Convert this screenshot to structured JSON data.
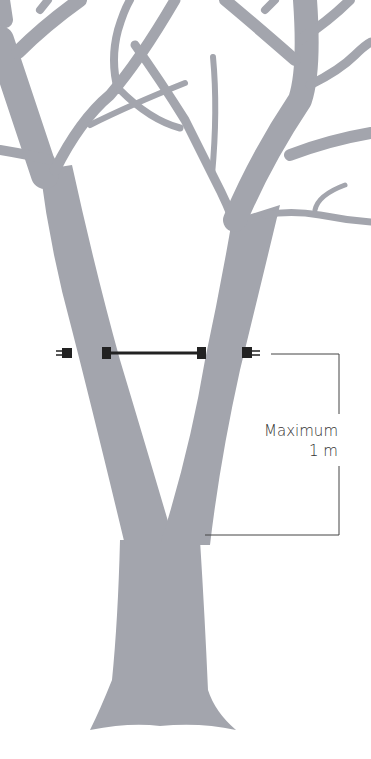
{
  "diagram": {
    "annotation": {
      "line1": "Maximum",
      "line2": "1 m"
    },
    "colors": {
      "trunk": "#a3a5ad",
      "brace": "#222222",
      "dimension_line": "#444444",
      "background": "#ffffff"
    }
  }
}
